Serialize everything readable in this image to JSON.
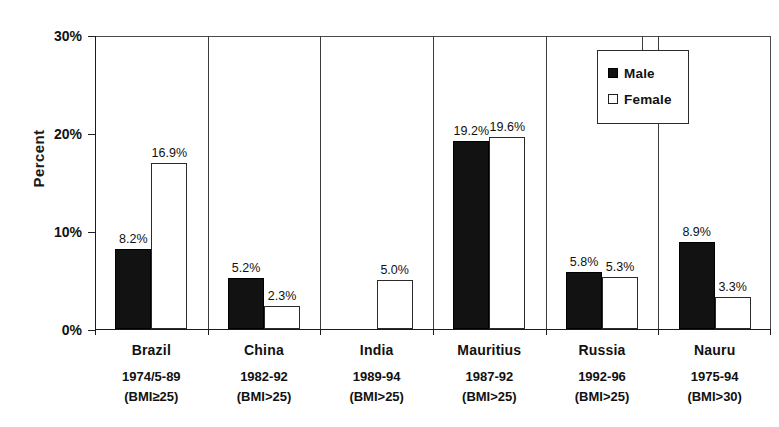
{
  "chart_data": {
    "type": "bar",
    "title": "",
    "xlabel": "",
    "ylabel": "Percent",
    "ylim": [
      0,
      30
    ],
    "ytick_labels": [
      "0%",
      "10%",
      "20%",
      "30%"
    ],
    "ytick_values": [
      0,
      10,
      20,
      30
    ],
    "grid": false,
    "legend_position": "top-right inside plot",
    "categories": [
      "Brazil",
      "China",
      "India",
      "Mauritius",
      "Russia",
      "Nauru"
    ],
    "category_sublabels": [
      {
        "years": "1974/5-89",
        "bmi": "(BMI≥25)"
      },
      {
        "years": "1982-92",
        "bmi": "(BMI>25)"
      },
      {
        "years": "1989-94",
        "bmi": "(BMI>25)"
      },
      {
        "years": "1987-92",
        "bmi": "(BMI>25)"
      },
      {
        "years": "1992-96",
        "bmi": "(BMI>25)"
      },
      {
        "years": "1975-94",
        "bmi": "(BMI>30)"
      }
    ],
    "series": [
      {
        "name": "Male",
        "color": "#121212",
        "values": [
          8.2,
          5.2,
          null,
          19.2,
          5.8,
          8.9
        ],
        "data_labels": [
          "8.2%",
          "5.2%",
          "",
          "19.2%",
          "5.8%",
          "8.9%"
        ]
      },
      {
        "name": "Female",
        "color": "#ffffff",
        "values": [
          16.9,
          2.3,
          5.0,
          19.6,
          5.3,
          3.3
        ],
        "data_labels": [
          "16.9%",
          "2.3%",
          "5.0%",
          "19.6%",
          "5.3%",
          "3.3%"
        ]
      }
    ]
  },
  "axis": {
    "y_label": "Percent",
    "y_ticks": [
      {
        "label": "30%",
        "value": 30
      },
      {
        "label": "20%",
        "value": 20
      },
      {
        "label": "10%",
        "value": 10
      },
      {
        "label": "0%",
        "value": 0
      }
    ]
  },
  "legend": {
    "items": [
      {
        "label": "Male",
        "swatch": "filled-square-icon"
      },
      {
        "label": "Female",
        "swatch": "open-square-icon"
      }
    ]
  }
}
